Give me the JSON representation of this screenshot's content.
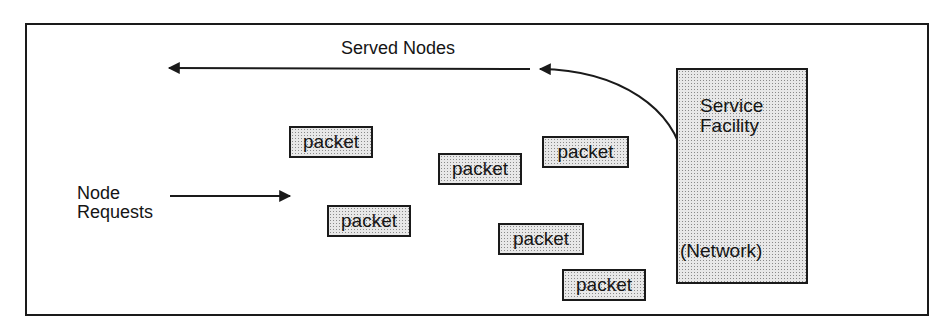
{
  "diagram": {
    "served_label": "Served Nodes",
    "requests_label_line1": "Node",
    "requests_label_line2": "Requests",
    "facility": {
      "title_line1": "Service",
      "title_line2": "Facility",
      "subtitle": "(Network)"
    },
    "packets": [
      {
        "label": "packet"
      },
      {
        "label": "packet"
      },
      {
        "label": "packet"
      },
      {
        "label": "packet"
      },
      {
        "label": "packet"
      },
      {
        "label": "packet"
      }
    ],
    "colors": {
      "stroke": "#1a1a1a",
      "fill_pattern": "#e8e8e8"
    }
  }
}
